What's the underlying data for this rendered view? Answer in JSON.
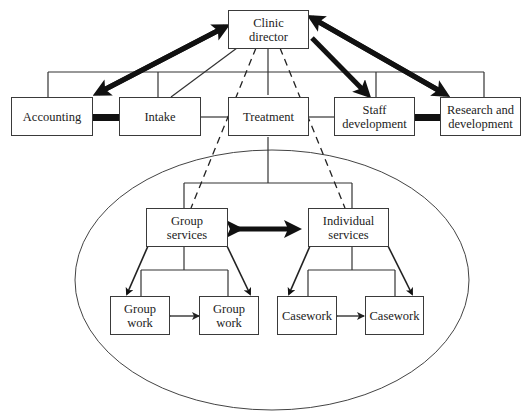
{
  "diagram": {
    "type": "organizational-chart",
    "nodes": {
      "director": "Clinic\ndirector",
      "accounting": "Accounting",
      "intake": "Intake",
      "treatment": "Treatment",
      "staff_dev": "Staff\ndevelopment",
      "research_dev": "Research and\ndevelopment",
      "group_services": "Group\nservices",
      "individual_services": "Individual\nservices",
      "group_work_1": "Group\nwork",
      "group_work_2": "Group\nwork",
      "casework_1": "Casework",
      "casework_2": "Casework"
    },
    "edges": [
      {
        "from": "director",
        "to": "accounting",
        "style": "thick-arrow",
        "direction": "both"
      },
      {
        "from": "director",
        "to": "intake",
        "style": "thin-line"
      },
      {
        "from": "director",
        "to": "staff_dev",
        "style": "thick-arrow",
        "direction": "to"
      },
      {
        "from": "director",
        "to": "research_dev",
        "style": "thick-arrow",
        "direction": "both"
      },
      {
        "from": "director",
        "to": "group_services",
        "style": "dashed"
      },
      {
        "from": "director",
        "to": "individual_services",
        "style": "dashed"
      },
      {
        "from": "accounting",
        "to": "intake",
        "style": "thick-bar"
      },
      {
        "from": "staff_dev",
        "to": "research_dev",
        "style": "thick-bar"
      },
      {
        "from": "group_services",
        "to": "individual_services",
        "style": "thick-double-arrow"
      },
      {
        "from": "group_services",
        "to": "group_work_1",
        "style": "arrow"
      },
      {
        "from": "group_services",
        "to": "group_work_2",
        "style": "arrow"
      },
      {
        "from": "individual_services",
        "to": "casework_1",
        "style": "arrow"
      },
      {
        "from": "individual_services",
        "to": "casework_2",
        "style": "arrow"
      },
      {
        "from": "group_work_1",
        "to": "group_work_2",
        "style": "double-arrow"
      },
      {
        "from": "casework_1",
        "to": "casework_2",
        "style": "double-arrow"
      }
    ],
    "grouping": "Treatment subunits enclosed in ellipse",
    "line_color": "#2a2a2a"
  }
}
